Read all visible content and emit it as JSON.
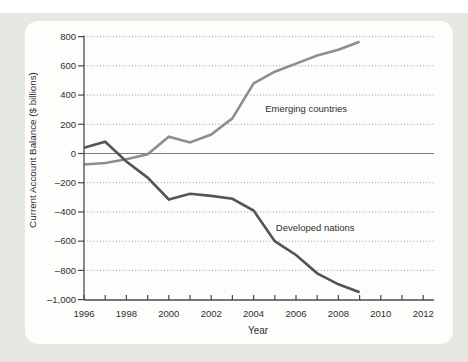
{
  "page": {
    "background_color": "#ffffff",
    "panel_color": "#e7e7e4",
    "card_color": "#fdfdfc"
  },
  "chart_data": {
    "type": "line",
    "title": "",
    "xlabel": "Year",
    "ylabel": "Current Account Balance ($ billions)",
    "x": [
      1996,
      1997,
      1998,
      1999,
      2000,
      2001,
      2002,
      2003,
      2004,
      2005,
      2006,
      2007,
      2008,
      2009
    ],
    "series": [
      {
        "name": "Emerging countries",
        "color": "#8e8e8e",
        "values": [
          -75,
          -65,
          -40,
          -5,
          115,
          75,
          130,
          240,
          480,
          560,
          615,
          670,
          710,
          765
        ]
      },
      {
        "name": "Developed nations",
        "color": "#555555",
        "values": [
          40,
          80,
          -55,
          -165,
          -315,
          -275,
          -290,
          -310,
          -390,
          -600,
          -695,
          -820,
          -895,
          -950
        ]
      }
    ],
    "xlim": [
      1996,
      2012.5
    ],
    "ylim": [
      -1000,
      800
    ],
    "yticks": {
      "values": [
        800,
        600,
        400,
        200,
        0,
        -200,
        -400,
        -600,
        -800,
        -1000
      ],
      "labels": [
        "800",
        "600",
        "400",
        "200",
        "0",
        "–200",
        "–400",
        "–600",
        "–800",
        "–1,000"
      ]
    },
    "xticks_labeled": [
      1996,
      1998,
      2000,
      2002,
      2004,
      2006,
      2008,
      2010,
      2012
    ],
    "xticks_minor": [
      1996,
      1997,
      1998,
      1999,
      2000,
      2001,
      2002,
      2003,
      2004,
      2005,
      2006,
      2007,
      2008,
      2009,
      2010,
      2011,
      2012
    ],
    "grid": {
      "horizontal_dotted": [
        800,
        600,
        400,
        200,
        -200,
        -400,
        -600,
        -800
      ],
      "zero_line": true
    },
    "legend_position": "inline-annotations",
    "annotations": [
      {
        "text": "Emerging countries",
        "x": 2004.55,
        "y": 308
      },
      {
        "text": "Developed nations",
        "x": 2005.05,
        "y": -505
      }
    ],
    "colors": {
      "grid": "#999999",
      "zero_line": "#7f7f7f",
      "axis": "#4a4a4a",
      "text": "#2e2e2e"
    }
  }
}
